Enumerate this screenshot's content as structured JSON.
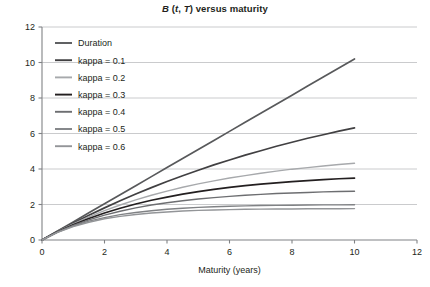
{
  "chart_data": {
    "type": "line",
    "title": "B (t, T) versus maturity",
    "title_parts": {
      "b": "B",
      "open": " (",
      "t": "t",
      "comma": ", ",
      "T": "T",
      "close": ") versus maturity"
    },
    "xlabel": "Maturity (years)",
    "ylabel": "",
    "xlim": [
      0,
      12
    ],
    "ylim": [
      0,
      12
    ],
    "xticks": [
      0,
      2,
      4,
      6,
      8,
      10,
      12
    ],
    "yticks": [
      0,
      2,
      4,
      6,
      8,
      10,
      12
    ],
    "grid": true,
    "legend_position": "upper-left-inside",
    "x": [
      0,
      0.5,
      1,
      1.5,
      2,
      2.5,
      3,
      3.5,
      4,
      4.5,
      5,
      5.5,
      6,
      6.5,
      7,
      7.5,
      8,
      8.5,
      9,
      9.5,
      10
    ],
    "series": [
      {
        "name": "Duration",
        "color": "#58595b",
        "kappa": 0,
        "end_value": 10.2,
        "values": [
          0,
          0.51,
          1.02,
          1.53,
          2.04,
          2.55,
          3.06,
          3.57,
          4.08,
          4.59,
          5.1,
          5.61,
          6.12,
          6.63,
          7.14,
          7.65,
          8.16,
          8.67,
          9.18,
          9.69,
          10.2
        ]
      },
      {
        "name": "kappa = 0.1",
        "color": "#414042",
        "kappa": 0.1,
        "end_value": 6.4,
        "values": [
          0,
          0.49,
          0.95,
          1.39,
          1.81,
          2.21,
          2.59,
          2.95,
          3.3,
          3.62,
          3.93,
          4.23,
          4.51,
          4.78,
          5.03,
          5.28,
          5.51,
          5.73,
          5.93,
          6.13,
          6.32
        ]
      },
      {
        "name": "kappa = 0.2",
        "color": "#a7a9ac",
        "kappa": 0.2,
        "end_value": 4.4,
        "values": [
          0,
          0.48,
          0.91,
          1.3,
          1.65,
          1.97,
          2.26,
          2.52,
          2.75,
          2.97,
          3.16,
          3.33,
          3.49,
          3.63,
          3.76,
          3.88,
          3.99,
          4.08,
          4.17,
          4.25,
          4.32
        ]
      },
      {
        "name": "kappa = 0.3",
        "color": "#231f20",
        "kappa": 0.3,
        "end_value": 3.2,
        "values": [
          0,
          0.46,
          0.86,
          1.21,
          1.52,
          1.79,
          2.03,
          2.24,
          2.42,
          2.58,
          2.73,
          2.85,
          2.96,
          3.06,
          3.15,
          3.22,
          3.29,
          3.35,
          3.4,
          3.45,
          3.49
        ]
      },
      {
        "name": "kappa = 0.4",
        "color": "#6d6e71",
        "kappa": 0.4,
        "end_value": 2.5,
        "values": [
          0,
          0.45,
          0.82,
          1.13,
          1.4,
          1.62,
          1.81,
          1.97,
          2.1,
          2.21,
          2.31,
          2.39,
          2.46,
          2.52,
          2.57,
          2.62,
          2.65,
          2.68,
          2.71,
          2.73,
          2.75
        ]
      },
      {
        "name": "kappa = 0.5",
        "color": "#808285",
        "kappa": 0.5,
        "end_value": 2.1,
        "values": [
          0,
          0.44,
          0.79,
          1.06,
          1.26,
          1.43,
          1.55,
          1.65,
          1.73,
          1.79,
          1.84,
          1.87,
          1.9,
          1.92,
          1.94,
          1.95,
          1.96,
          1.97,
          1.98,
          1.98,
          1.99
        ]
      },
      {
        "name": "kappa = 0.6",
        "color": "#939598",
        "kappa": 0.6,
        "end_value": 1.85,
        "values": [
          0,
          0.43,
          0.75,
          1.0,
          1.2,
          1.33,
          1.44,
          1.52,
          1.58,
          1.63,
          1.67,
          1.69,
          1.71,
          1.73,
          1.74,
          1.75,
          1.75,
          1.76,
          1.76,
          1.76,
          1.77
        ]
      }
    ]
  },
  "legend": {
    "entries": [
      {
        "label": "Duration"
      },
      {
        "label": "kappa = 0.1"
      },
      {
        "label": "kappa = 0.2"
      },
      {
        "label": "kappa = 0.3"
      },
      {
        "label": "kappa = 0.4"
      },
      {
        "label": "kappa = 0.5"
      },
      {
        "label": "kappa = 0.6"
      }
    ]
  },
  "colors": {
    "grid": "#bcbec0",
    "axis": "#808285",
    "text": "#231f20",
    "background": "#ffffff"
  }
}
